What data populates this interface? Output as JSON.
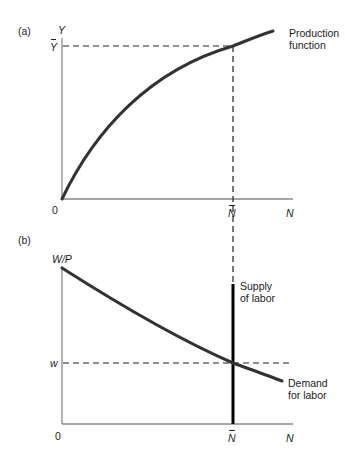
{
  "panel_a": {
    "tag": "(a)",
    "y_axis_label": "Y",
    "y_marker": "Y",
    "origin": "0",
    "x_marker": "N",
    "x_axis_label": "N",
    "curve_label_line1": "Production",
    "curve_label_line2": "function"
  },
  "panel_b": {
    "tag": "(b)",
    "y_axis_label": "W/P",
    "y_marker": "w",
    "origin": "0",
    "x_marker": "N",
    "x_axis_label": "N",
    "supply_label_line1": "Supply",
    "supply_label_line2": "of labor",
    "demand_label_line1": "Demand",
    "demand_label_line2": "for labor"
  },
  "colors": {
    "curve": "#333333",
    "axis": "#888888",
    "supply": "#000000",
    "dash": "#222222"
  }
}
